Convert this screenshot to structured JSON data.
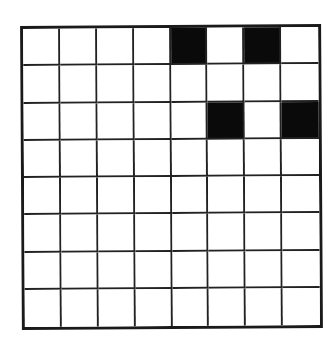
{
  "grid": {
    "rows": 8,
    "cols": 8,
    "filled_color": "#0a0a0a",
    "empty_color": "#ffffff",
    "line_color": "#222222",
    "cells": [
      [
        0,
        0,
        0,
        0,
        1,
        0,
        1,
        0
      ],
      [
        0,
        0,
        0,
        0,
        0,
        0,
        0,
        0
      ],
      [
        0,
        0,
        0,
        0,
        0,
        1,
        0,
        1
      ],
      [
        0,
        0,
        0,
        0,
        0,
        0,
        0,
        0
      ],
      [
        0,
        0,
        0,
        0,
        0,
        0,
        0,
        0
      ],
      [
        0,
        0,
        0,
        0,
        0,
        0,
        0,
        0
      ],
      [
        0,
        0,
        0,
        0,
        0,
        0,
        0,
        0
      ],
      [
        0,
        0,
        0,
        0,
        0,
        0,
        0,
        0
      ]
    ],
    "filled_positions": [
      {
        "row": 0,
        "col": 4
      },
      {
        "row": 0,
        "col": 6
      },
      {
        "row": 2,
        "col": 5
      },
      {
        "row": 2,
        "col": 7
      }
    ]
  }
}
